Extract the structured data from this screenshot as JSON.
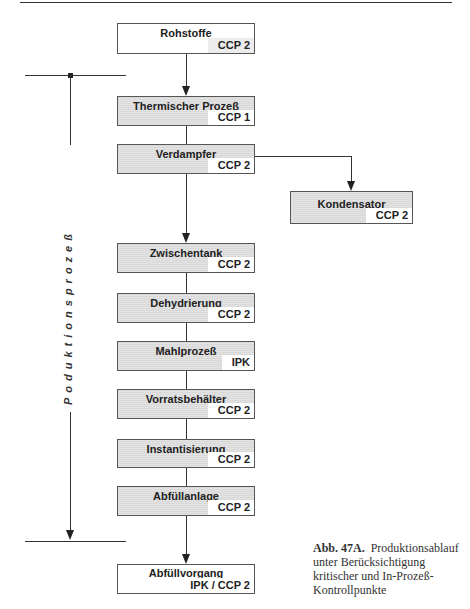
{
  "diagram": {
    "side_label": "Poduktionsprozeß",
    "nodes": [
      {
        "id": "rohstoffe",
        "title": "Rohstoffe",
        "code": "CCP 2",
        "shaded": false
      },
      {
        "id": "thermischer-prozess",
        "title": "Thermischer Prozeß",
        "code": "CCP 1",
        "shaded": true
      },
      {
        "id": "verdampfer",
        "title": "Verdampfer",
        "code": "CCP 2",
        "shaded": true
      },
      {
        "id": "kondensator",
        "title": "Kondensator",
        "code": "CCP 2",
        "shaded": true
      },
      {
        "id": "zwischentank",
        "title": "Zwischentank",
        "code": "CCP 2",
        "shaded": true
      },
      {
        "id": "dehydrierung",
        "title": "Dehydrierung",
        "code": "CCP 2",
        "shaded": true
      },
      {
        "id": "mahlprozess",
        "title": "Mahlprozeß",
        "code": "IPK",
        "shaded": true
      },
      {
        "id": "vorratsbehaelter",
        "title": "Vorratsbehälter",
        "code": "CCP 2",
        "shaded": true
      },
      {
        "id": "instantisierung",
        "title": "Instantisierung",
        "code": "CCP 2",
        "shaded": true
      },
      {
        "id": "abfuellanlage",
        "title": "Abfüllanlage",
        "code": "CCP 2",
        "shaded": true
      },
      {
        "id": "abfuellvorgang",
        "title": "Abfüllvorgang",
        "code": "IPK / CCP 2",
        "shaded": false
      }
    ]
  },
  "caption": {
    "label": "Abb. 47A.",
    "text": "Produktionsablauf unter Berücksichtigung kritischer und In-Prozeß-Kontrollpunkte"
  }
}
